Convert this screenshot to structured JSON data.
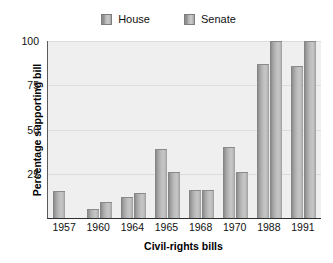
{
  "chart_data": {
    "type": "bar",
    "title": "",
    "xlabel": "Civil-rights bills",
    "ylabel": "Percentage supporting bill",
    "categories": [
      "1957",
      "1960",
      "1964",
      "1965",
      "1968",
      "1970",
      "1988",
      "1991"
    ],
    "series": [
      {
        "name": "House",
        "values": [
          15,
          5,
          12,
          39,
          16,
          40,
          87,
          86
        ]
      },
      {
        "name": "Senate",
        "values": [
          0,
          9,
          14,
          26,
          16,
          26,
          100,
          100
        ]
      }
    ],
    "ylim": [
      0,
      100
    ],
    "yticks": [
      25,
      50,
      75,
      100
    ],
    "ytick_labels": [
      "25",
      "50",
      "75",
      "100"
    ],
    "grid": true,
    "legend_position": "top-center",
    "colors": {
      "bar_light": "#c6c6c6",
      "bar_dark": "#7e7e7e",
      "plot_background": "#efefef",
      "gridline": "#dcdcdc",
      "axis": "#2e2e2e",
      "text": "#111111"
    }
  },
  "legend": {
    "items": [
      {
        "label": "House"
      },
      {
        "label": "Senate"
      }
    ]
  }
}
